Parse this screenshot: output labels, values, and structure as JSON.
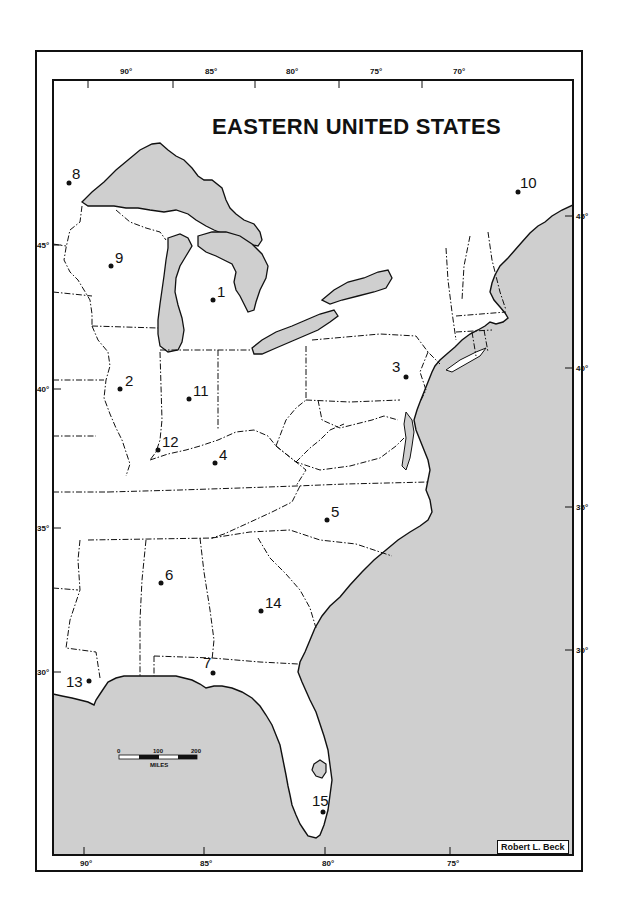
{
  "map": {
    "title": "EASTERN UNITED STATES",
    "credit": "Robert L. Beck",
    "colors": {
      "water": "#cfcfcf",
      "land": "#ffffff",
      "line": "#111111"
    },
    "longitude_ticks_top": [
      "90°",
      "85°",
      "80°",
      "75°",
      "70°"
    ],
    "longitude_ticks_bottom": [
      "90°",
      "85°",
      "80°",
      "75°"
    ],
    "latitude_ticks_left": [
      "45°",
      "40°",
      "35°",
      "30°"
    ],
    "latitude_ticks_right": [
      "45°",
      "40°",
      "35°",
      "30°"
    ],
    "scale_bar": {
      "labels": [
        "0",
        "100",
        "200"
      ],
      "unit": "MILES"
    },
    "markers": [
      {
        "id": "1",
        "label": "1"
      },
      {
        "id": "2",
        "label": "2"
      },
      {
        "id": "3",
        "label": "3"
      },
      {
        "id": "4",
        "label": "4"
      },
      {
        "id": "5",
        "label": "5"
      },
      {
        "id": "6",
        "label": "6"
      },
      {
        "id": "7",
        "label": "7"
      },
      {
        "id": "8",
        "label": "8"
      },
      {
        "id": "9",
        "label": "9"
      },
      {
        "id": "10",
        "label": "10"
      },
      {
        "id": "11",
        "label": "11"
      },
      {
        "id": "12",
        "label": "12"
      },
      {
        "id": "13",
        "label": "13"
      },
      {
        "id": "14",
        "label": "14"
      },
      {
        "id": "15",
        "label": "15"
      }
    ]
  }
}
